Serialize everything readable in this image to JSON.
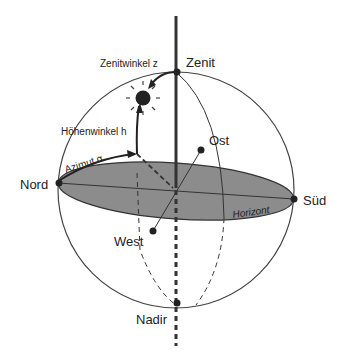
{
  "labels": {
    "zenit": "Zenit",
    "nadir": "Nadir",
    "nord": "Nord",
    "sued": "Süd",
    "ost": "Ost",
    "west": "West",
    "horizont": "Horizont",
    "zenitwinkel": "Zenitwinkel z",
    "hoehenwinkel": "Höhenwinkel h",
    "azimut": "Azimut α"
  },
  "colors": {
    "horizon_fill": "#8c8c8c",
    "line": "#333333",
    "background": "#ffffff"
  }
}
